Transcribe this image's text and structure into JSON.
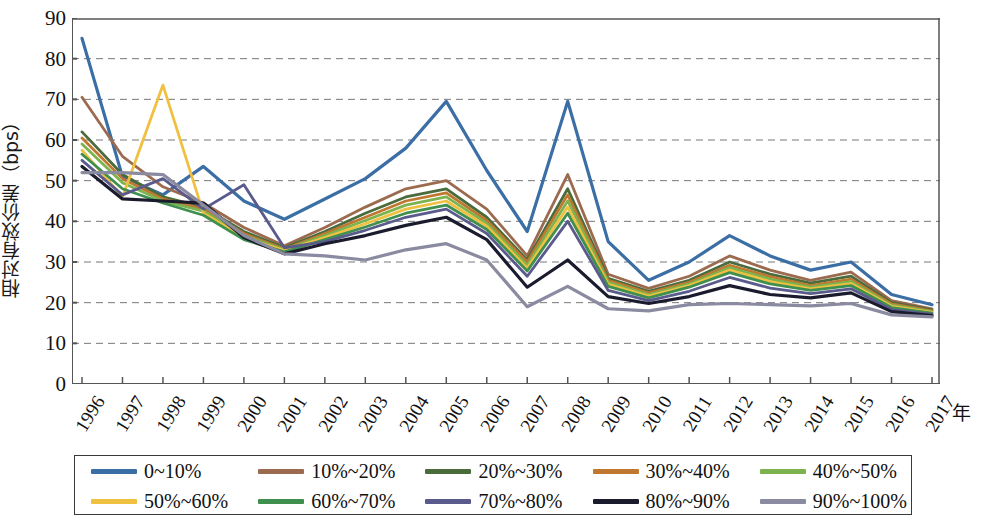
{
  "chart_data": {
    "type": "line",
    "title": "",
    "xlabel": "年",
    "ylabel": "相对有效价差（bps）",
    "ylim": [
      0,
      90
    ],
    "yticks": [
      0,
      10,
      20,
      30,
      40,
      50,
      60,
      70,
      80,
      90
    ],
    "grid": true,
    "legend_position": "bottom",
    "categories": [
      "1996",
      "1997",
      "1998",
      "1999",
      "2000",
      "2001",
      "2002",
      "2003",
      "2004",
      "2005",
      "2006",
      "2007",
      "2008",
      "2009",
      "2010",
      "2011",
      "2012",
      "2013",
      "2014",
      "2015",
      "2016",
      "2017"
    ],
    "series": [
      {
        "name": "0~10%",
        "color": "#3b6ea5",
        "values": [
          85.0,
          51.0,
          46.5,
          53.5,
          45.0,
          40.5,
          45.5,
          50.5,
          58.0,
          69.5,
          52.5,
          37.5,
          69.5,
          35.0,
          25.5,
          30.0,
          36.5,
          31.5,
          28.0,
          30.0,
          22.0,
          19.5
        ]
      },
      {
        "name": "10%~20%",
        "color": "#9c6b4f",
        "values": [
          70.5,
          56.0,
          48.5,
          44.5,
          38.5,
          34.0,
          38.5,
          43.5,
          48.0,
          50.0,
          43.0,
          31.5,
          51.5,
          27.0,
          23.5,
          26.5,
          31.5,
          28.0,
          25.5,
          27.5,
          20.5,
          18.5
        ]
      },
      {
        "name": "20%~30%",
        "color": "#4a6b3c",
        "values": [
          62.0,
          51.5,
          46.0,
          43.5,
          37.5,
          33.5,
          37.5,
          42.0,
          46.0,
          48.0,
          41.0,
          30.5,
          48.0,
          26.0,
          22.8,
          25.5,
          30.0,
          27.0,
          24.8,
          26.5,
          20.0,
          18.2
        ]
      },
      {
        "name": "30%~40%",
        "color": "#c07830",
        "values": [
          60.5,
          50.5,
          45.5,
          43.0,
          37.0,
          33.2,
          37.0,
          41.0,
          45.0,
          47.0,
          40.2,
          30.0,
          46.5,
          25.5,
          22.4,
          25.0,
          29.2,
          26.4,
          24.2,
          25.8,
          19.7,
          18.0
        ]
      },
      {
        "name": "40%~50%",
        "color": "#7cb34e",
        "values": [
          59.0,
          49.5,
          45.0,
          42.5,
          36.5,
          33.0,
          36.5,
          40.2,
          44.0,
          46.0,
          39.5,
          29.2,
          45.0,
          25.0,
          22.0,
          24.6,
          28.6,
          25.8,
          23.8,
          25.2,
          19.4,
          17.8
        ]
      },
      {
        "name": "50%~60%",
        "color": "#f0c040",
        "values": [
          57.5,
          46.0,
          73.5,
          42.0,
          36.0,
          32.8,
          36.0,
          39.4,
          43.0,
          45.0,
          38.8,
          28.5,
          43.5,
          24.5,
          21.6,
          24.2,
          28.0,
          25.2,
          23.4,
          24.7,
          19.1,
          17.6
        ]
      },
      {
        "name": "60%~70%",
        "color": "#3f8f4e",
        "values": [
          56.5,
          48.0,
          44.5,
          41.5,
          35.5,
          32.5,
          35.5,
          38.6,
          42.0,
          44.0,
          38.0,
          27.8,
          42.0,
          24.0,
          21.2,
          23.8,
          27.4,
          24.6,
          23.0,
          24.2,
          18.8,
          17.4
        ]
      },
      {
        "name": "70%~80%",
        "color": "#5a5a8c",
        "values": [
          55.0,
          46.5,
          50.5,
          43.0,
          49.0,
          33.5,
          35.0,
          37.8,
          41.0,
          43.0,
          37.0,
          26.5,
          40.0,
          23.0,
          20.5,
          22.8,
          26.2,
          23.6,
          22.2,
          23.4,
          18.3,
          17.1
        ]
      },
      {
        "name": "80%~90%",
        "color": "#1b1b2e",
        "values": [
          53.5,
          45.5,
          45.0,
          44.5,
          36.0,
          32.0,
          34.5,
          36.5,
          39.0,
          41.0,
          35.5,
          23.8,
          30.5,
          21.5,
          19.8,
          21.5,
          24.2,
          22.0,
          21.2,
          22.4,
          17.8,
          16.8
        ]
      },
      {
        "name": "90%~100%",
        "color": "#8a8aa0",
        "values": [
          52.0,
          52.0,
          51.5,
          44.0,
          36.5,
          32.0,
          31.5,
          30.5,
          33.0,
          34.5,
          30.5,
          19.0,
          24.0,
          18.5,
          18.0,
          19.5,
          19.8,
          19.5,
          19.2,
          19.8,
          17.0,
          16.5
        ]
      }
    ]
  },
  "axes": {
    "y_label": "相对有效价差（bps）",
    "x_axis_unit": "年",
    "y_ticks": [
      "90",
      "80",
      "70",
      "60",
      "50",
      "40",
      "30",
      "20",
      "10",
      "0"
    ],
    "x_ticks": [
      "1996",
      "1997",
      "1998",
      "1999",
      "2000",
      "2001",
      "2002",
      "2003",
      "2004",
      "2005",
      "2006",
      "2007",
      "2008",
      "2009",
      "2010",
      "2011",
      "2012",
      "2013",
      "2014",
      "2015",
      "2016",
      "2017"
    ]
  },
  "legend": {
    "items": [
      {
        "label": "0~10%",
        "color": "#3b6ea5"
      },
      {
        "label": "10%~20%",
        "color": "#9c6b4f"
      },
      {
        "label": "20%~30%",
        "color": "#4a6b3c"
      },
      {
        "label": "30%~40%",
        "color": "#c07830"
      },
      {
        "label": "40%~50%",
        "color": "#7cb34e"
      },
      {
        "label": "50%~60%",
        "color": "#f0c040"
      },
      {
        "label": "60%~70%",
        "color": "#3f8f4e"
      },
      {
        "label": "70%~80%",
        "color": "#5a5a8c"
      },
      {
        "label": "80%~90%",
        "color": "#1b1b2e"
      },
      {
        "label": "90%~100%",
        "color": "#8a8aa0"
      }
    ]
  }
}
